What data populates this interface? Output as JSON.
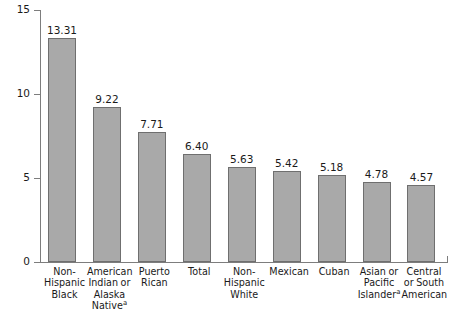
{
  "chart_data": {
    "type": "bar",
    "title": "",
    "xlabel": "",
    "ylabel": "Rate per 1,000 live births",
    "ylim": [
      0,
      15
    ],
    "yticks": [
      0,
      5,
      10,
      15
    ],
    "ytick_labels": [
      "0",
      "5",
      "10",
      "15"
    ],
    "grid": false,
    "legend": null,
    "categories": [
      "Non-Hispanic Black",
      "American Indian or Alaska Native",
      "Puerto Rican",
      "Total",
      "Non-Hispanic White",
      "Mexican",
      "Cuban",
      "Asian or Pacific Islander",
      "Central or South American"
    ],
    "category_lines": [
      [
        "Non-",
        "Hispanic",
        "Black"
      ],
      [
        "American",
        "Indian or",
        "Alaska",
        "Native"
      ],
      [
        "Puerto",
        "Rican"
      ],
      [
        "Total"
      ],
      [
        "Non-",
        "Hispanic",
        "White"
      ],
      [
        "Mexican"
      ],
      [
        "Cuban"
      ],
      [
        "Asian or",
        "Pacific",
        "Islander"
      ],
      [
        "Central",
        "or South",
        "American"
      ]
    ],
    "footnote_markers": {
      "1": "a",
      "7": "a"
    },
    "values": [
      13.31,
      9.22,
      7.71,
      6.4,
      5.63,
      5.42,
      5.18,
      4.78,
      4.57
    ],
    "value_labels": [
      "13.31",
      "9.22",
      "7.71",
      "6.40",
      "5.63",
      "5.42",
      "5.18",
      "4.78",
      "4.57"
    ],
    "bar_color": "#a9a9a9",
    "bar_edge_color": "#6f6f6f",
    "axis_color": "#7d7d7d",
    "background_color": "#ffffff"
  }
}
